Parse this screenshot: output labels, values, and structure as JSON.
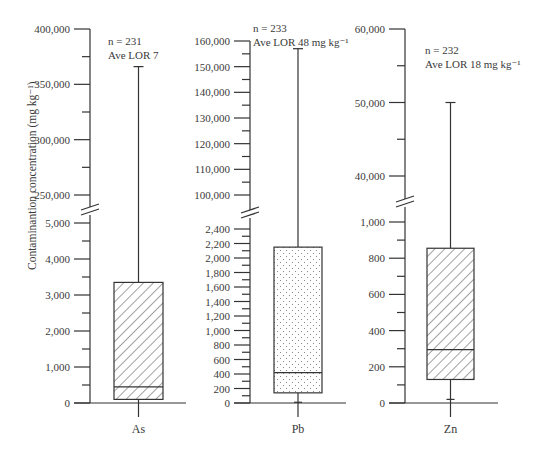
{
  "chart_data": {
    "type": "box",
    "ylabel": "Contaminantion concentration (mg kg⁻¹)",
    "axis_break": true,
    "panels": [
      {
        "category": "As",
        "annotation": [
          "n = 231",
          "Ave LOR 7"
        ],
        "pattern": "hatch",
        "lower_scale": {
          "ticks": [
            0,
            1000,
            2000,
            3000,
            4000,
            5000
          ],
          "labels": [
            "0",
            "1,000",
            "2,000",
            "3,000",
            "4,000",
            "5,000"
          ],
          "range": [
            0,
            5000
          ]
        },
        "upper_scale": {
          "ticks": [
            250000,
            300000,
            350000,
            400000
          ],
          "labels": [
            "250,000",
            "300,000",
            "350,000",
            "400,000"
          ],
          "range": [
            250000,
            400000
          ]
        },
        "box": {
          "whisker_low": 0,
          "q1": 100,
          "median": 450,
          "q3": 3350,
          "whisker_high": 366000
        }
      },
      {
        "category": "Pb",
        "annotation": [
          "n = 233",
          "Ave LOR 48 mg kg⁻¹"
        ],
        "pattern": "dots",
        "lower_scale": {
          "ticks": [
            0,
            200,
            400,
            600,
            800,
            1000,
            1200,
            1400,
            1600,
            1800,
            2000,
            2200,
            2400
          ],
          "labels": [
            "0",
            "200",
            "400",
            "600",
            "800",
            "1,000",
            "1,200",
            "1,400",
            "1,600",
            "1,800",
            "2,000",
            "2,200",
            "2,400"
          ],
          "range": [
            0,
            2400
          ]
        },
        "upper_scale": {
          "ticks": [
            100000,
            110000,
            120000,
            130000,
            140000,
            150000,
            160000
          ],
          "labels": [
            "100,000",
            "110,000",
            "120,000",
            "130,000",
            "140,000",
            "150,000",
            "160,000"
          ],
          "range": [
            100000,
            160000
          ]
        },
        "box": {
          "whisker_low": 10,
          "q1": 140,
          "median": 420,
          "q3": 2150,
          "whisker_high": 157000
        }
      },
      {
        "category": "Zn",
        "annotation": [
          "n = 232",
          "Ave LOR 18 mg kg⁻¹"
        ],
        "pattern": "hatch",
        "lower_scale": {
          "ticks": [
            0,
            200,
            400,
            600,
            800,
            1000
          ],
          "labels": [
            "0",
            "200",
            "400",
            "600",
            "800",
            "1,000"
          ],
          "range": [
            0,
            1000
          ]
        },
        "upper_scale": {
          "ticks": [
            40000,
            50000,
            60000
          ],
          "labels": [
            "40,000",
            "50,000",
            "60,000"
          ],
          "range": [
            40000,
            60000
          ]
        },
        "box": {
          "whisker_low": 20,
          "q1": 130,
          "median": 295,
          "q3": 855,
          "whisker_high": 50000
        }
      }
    ]
  }
}
